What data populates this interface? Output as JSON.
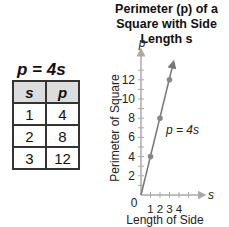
{
  "table": {
    "equation": "p = 4s",
    "headers": [
      "s",
      "p"
    ],
    "rows": [
      [
        "1",
        "4"
      ],
      [
        "2",
        "8"
      ],
      [
        "3",
        "12"
      ]
    ]
  },
  "chart_data": {
    "type": "line",
    "title": "Perimeter (p) of a Square with Side Length s",
    "xlabel": "Length of Side",
    "ylabel": "Perimeter of Square",
    "x_axis_var": "s",
    "y_axis_var": "p",
    "x_ticks": [
      "1",
      "2",
      "3",
      "4"
    ],
    "y_ticks": [
      "2",
      "4",
      "6",
      "8",
      "10",
      "12"
    ],
    "origin_label": "0",
    "series": [
      {
        "name": "p = 4s",
        "x": [
          1,
          2,
          3
        ],
        "y": [
          4,
          8,
          12
        ]
      }
    ],
    "annotation": "p = 4s",
    "xlim": [
      0,
      6
    ],
    "ylim": [
      0,
      14
    ],
    "grid": false
  }
}
